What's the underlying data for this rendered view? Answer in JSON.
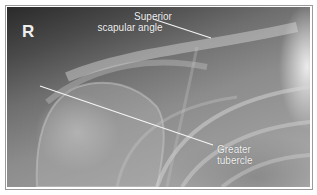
{
  "image": {
    "description": "Annotated right shoulder radiograph",
    "side_marker": "R",
    "annotations": [
      {
        "label_line1": "Superior",
        "label_line2": "scapular angle",
        "target": "superior-scapular-angle"
      },
      {
        "label_line1": "Greater",
        "label_line2": "tubercle",
        "target": "greater-tubercle"
      }
    ],
    "colors": {
      "border": "#9a9a9a",
      "annotation": "#f2f2f2",
      "background": "#ffffff"
    }
  }
}
